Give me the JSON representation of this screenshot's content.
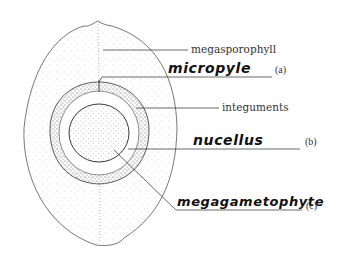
{
  "diagram": {
    "labels": {
      "megasporophyll": "megasporophyll",
      "micropyle": "micropyle",
      "micropyle_tag": "(a)",
      "integuments": "integuments",
      "nucellus": "nucellus",
      "nucellus_tag": "(b)",
      "megagametophyte": "megagametophyte",
      "megagametophyte_tag": "(c)"
    },
    "structures": [
      {
        "name": "megasporophyll",
        "type": "printed-label"
      },
      {
        "name": "micropyle",
        "type": "handwritten-answer",
        "tag": "(a)"
      },
      {
        "name": "integuments",
        "type": "printed-label"
      },
      {
        "name": "nucellus",
        "type": "handwritten-answer",
        "tag": "(b)"
      },
      {
        "name": "megagametophyte",
        "type": "handwritten-answer",
        "tag": "(c)"
      }
    ],
    "colors": {
      "line": "#444444",
      "stipple": "#777777",
      "background": "#ffffff"
    }
  }
}
